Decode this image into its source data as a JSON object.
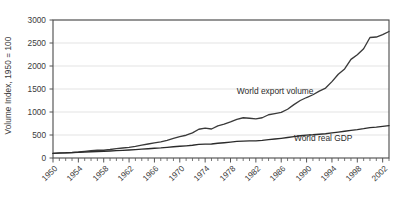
{
  "chart_data": {
    "type": "line",
    "title": "",
    "subtitle": "",
    "xlabel": "",
    "ylabel": "Volume Index, 1950 = 100",
    "xlim": [
      1950,
      2003
    ],
    "ylim": [
      0,
      3000
    ],
    "grid": true,
    "legend_position": "inline-annotations",
    "y_ticks": [
      0,
      500,
      1000,
      1500,
      2000,
      2500,
      3000
    ],
    "y_tick_labels": [
      "0",
      "500",
      "1000",
      "1500",
      "2000",
      "2500",
      "3000"
    ],
    "x_ticks": [
      1950,
      1954,
      1958,
      1962,
      1966,
      1970,
      1974,
      1978,
      1982,
      1986,
      1990,
      1994,
      1998,
      2002
    ],
    "x_tick_labels": [
      "1950",
      "1954",
      "1958",
      "1962",
      "1966",
      "1970",
      "1974",
      "1978",
      "1982",
      "1986",
      "1990",
      "1994",
      "1998",
      "2002"
    ],
    "x_minor_tick_step": 1,
    "x": [
      1950,
      1951,
      1952,
      1953,
      1954,
      1955,
      1956,
      1957,
      1958,
      1959,
      1960,
      1961,
      1962,
      1963,
      1964,
      1965,
      1966,
      1967,
      1968,
      1969,
      1970,
      1971,
      1972,
      1973,
      1974,
      1975,
      1976,
      1977,
      1978,
      1979,
      1980,
      1981,
      1982,
      1983,
      1984,
      1985,
      1986,
      1987,
      1988,
      1989,
      1990,
      1991,
      1992,
      1993,
      1994,
      1995,
      1996,
      1997,
      1998,
      1999,
      2000,
      2001,
      2002,
      2003
    ],
    "series": [
      {
        "name": "World export volume",
        "color": "#3a3a3a",
        "values": [
          100,
          112,
          114,
          120,
          130,
          144,
          158,
          168,
          168,
          184,
          205,
          218,
          232,
          252,
          280,
          305,
          330,
          350,
          382,
          425,
          465,
          495,
          545,
          625,
          650,
          630,
          700,
          735,
          785,
          840,
          875,
          865,
          850,
          875,
          940,
          965,
          990,
          1060,
          1160,
          1250,
          1315,
          1375,
          1455,
          1520,
          1660,
          1820,
          1935,
          2145,
          2245,
          2375,
          2620,
          2630,
          2680,
          2750
        ]
      },
      {
        "name": "World real GDP",
        "color": "#2b2b2b",
        "values": [
          100,
          105,
          110,
          116,
          121,
          129,
          135,
          140,
          145,
          152,
          160,
          166,
          174,
          182,
          192,
          202,
          212,
          220,
          232,
          245,
          255,
          265,
          278,
          296,
          302,
          305,
          320,
          332,
          346,
          360,
          368,
          372,
          374,
          384,
          400,
          414,
          428,
          445,
          465,
          483,
          498,
          505,
          516,
          528,
          546,
          564,
          582,
          602,
          618,
          638,
          662,
          672,
          688,
          705
        ]
      }
    ],
    "annotations": [
      {
        "text": "World export volume",
        "x": 1979,
        "y": 1450
      },
      {
        "text": "World real GDP",
        "x": 1988,
        "y": 430
      }
    ],
    "colors": {
      "background": "#ffffff",
      "grid": "#e3e3e3",
      "axis": "#555555",
      "frame": "#4a4a4a",
      "text": "#3b3b3b"
    }
  }
}
